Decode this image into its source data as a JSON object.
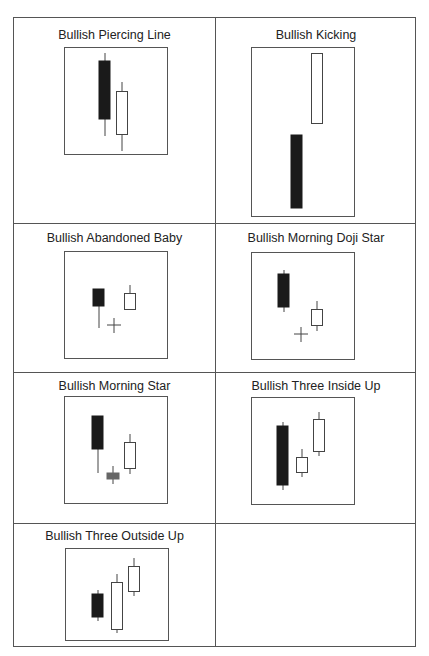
{
  "figure": {
    "patterns": [
      {
        "id": "piercing",
        "title": "Bullish Piercing Line"
      },
      {
        "id": "kicking",
        "title": "Bullish Kicking"
      },
      {
        "id": "abandoned",
        "title": "Bullish Abandoned Baby"
      },
      {
        "id": "morning_doji",
        "title": "Bullish Morning Doji Star"
      },
      {
        "id": "morning_star",
        "title": "Bullish Morning Star"
      },
      {
        "id": "three_inside",
        "title": "Bullish Three Inside Up"
      },
      {
        "id": "three_outside",
        "title": "Bullish Three Outside Up"
      }
    ],
    "colors": {
      "bearish_body": "#1a1a1a",
      "bullish_body": "#ffffff",
      "neutral_body": "#666666",
      "line": "#444444"
    }
  }
}
